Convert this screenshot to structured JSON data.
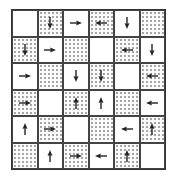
{
  "diagram": {
    "type": "grid-arrows",
    "rows": 6,
    "cols": 6,
    "colors": {
      "line": "#333333",
      "dot": "#777777",
      "arrow": "#222222",
      "background": "#ffffff"
    },
    "cells": [
      [
        {
          "dotted": false,
          "arrow": "none"
        },
        {
          "dotted": true,
          "arrow": "down"
        },
        {
          "dotted": false,
          "arrow": "right"
        },
        {
          "dotted": true,
          "arrow": "left"
        },
        {
          "dotted": false,
          "arrow": "down"
        },
        {
          "dotted": true,
          "arrow": "none"
        }
      ],
      [
        {
          "dotted": true,
          "arrow": "down"
        },
        {
          "dotted": false,
          "arrow": "right"
        },
        {
          "dotted": true,
          "arrow": "none"
        },
        {
          "dotted": false,
          "arrow": "none"
        },
        {
          "dotted": true,
          "arrow": "left"
        },
        {
          "dotted": false,
          "arrow": "down"
        }
      ],
      [
        {
          "dotted": false,
          "arrow": "right"
        },
        {
          "dotted": true,
          "arrow": "none"
        },
        {
          "dotted": false,
          "arrow": "down"
        },
        {
          "dotted": true,
          "arrow": "down"
        },
        {
          "dotted": false,
          "arrow": "none"
        },
        {
          "dotted": true,
          "arrow": "left"
        }
      ],
      [
        {
          "dotted": true,
          "arrow": "right"
        },
        {
          "dotted": false,
          "arrow": "none"
        },
        {
          "dotted": true,
          "arrow": "up"
        },
        {
          "dotted": false,
          "arrow": "up"
        },
        {
          "dotted": true,
          "arrow": "none"
        },
        {
          "dotted": false,
          "arrow": "left"
        }
      ],
      [
        {
          "dotted": false,
          "arrow": "up"
        },
        {
          "dotted": true,
          "arrow": "right"
        },
        {
          "dotted": false,
          "arrow": "none"
        },
        {
          "dotted": true,
          "arrow": "none"
        },
        {
          "dotted": false,
          "arrow": "left"
        },
        {
          "dotted": true,
          "arrow": "up"
        }
      ],
      [
        {
          "dotted": true,
          "arrow": "none"
        },
        {
          "dotted": false,
          "arrow": "up"
        },
        {
          "dotted": true,
          "arrow": "right"
        },
        {
          "dotted": false,
          "arrow": "left"
        },
        {
          "dotted": true,
          "arrow": "up"
        },
        {
          "dotted": false,
          "arrow": "none"
        }
      ]
    ]
  }
}
